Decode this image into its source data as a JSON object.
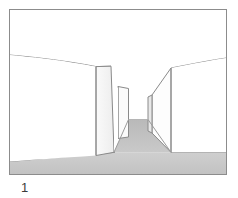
{
  "figure": {
    "caption_label": "1",
    "title": "",
    "frame": {
      "x": 9,
      "y": 9,
      "width": 218,
      "height": 166,
      "stroke_color": "#8c8c8c",
      "fill_color": "#ffffff",
      "stroke_width": 1
    },
    "palette": {
      "outline": "#7a7a7a",
      "outline_light": "#9b9b9b",
      "sky_fill": "#ffffff",
      "wall_fill": "#ffffff",
      "wall_shade_fill": "#f2f2f2",
      "ground_fill": "#c9c9c9",
      "ground_fill_dark": "#bdbdbd",
      "caption_color": "#3b3b3b",
      "page_background": "#ffffff"
    },
    "scene": {
      "type": "perspective-corridor-line-drawing",
      "description_name": "corridor-between-two-walls",
      "vanishing_point": {
        "x": 131,
        "y": 120
      },
      "horizon": {
        "name": "upper-wall-top-curve",
        "left_start": {
          "x": 10,
          "y": 55
        },
        "left_end": {
          "x": 111,
          "y": 66
        },
        "right_start": {
          "x": 170,
          "y": 68
        },
        "right_end": {
          "x": 226,
          "y": 58
        }
      },
      "ground_line": {
        "name": "ground-front-curve",
        "left_point": {
          "x": 10,
          "y": 161
        },
        "mid_point": {
          "x": 115,
          "y": 152
        },
        "right_point": {
          "x": 226,
          "y": 152
        }
      },
      "left_wall": {
        "name": "left-wall-near-panel",
        "top_front": {
          "x": 96,
          "y": 67
        },
        "top_back": {
          "x": 111,
          "y": 66
        },
        "bottom_front": {
          "x": 96,
          "y": 155
        },
        "bottom_back": {
          "x": 114,
          "y": 152
        }
      },
      "left_wall_far": {
        "name": "left-wall-far-panel",
        "top_front": {
          "x": 118,
          "y": 86
        },
        "top_back": {
          "x": 128,
          "y": 88
        },
        "bottom_front": {
          "x": 118,
          "y": 138
        },
        "bottom_back": {
          "x": 128,
          "y": 137
        }
      },
      "right_wall": {
        "name": "right-wall-near-panel",
        "top_back": {
          "x": 152,
          "y": 95
        },
        "top_front": {
          "x": 171,
          "y": 68
        },
        "bottom_back": {
          "x": 152,
          "y": 133
        },
        "bottom_front": {
          "x": 171,
          "y": 152
        }
      },
      "right_wall_far": {
        "name": "right-wall-far-panel",
        "top": {
          "x": 148,
          "y": 97
        },
        "bottom": {
          "x": 148,
          "y": 131
        }
      },
      "corridor_floor": {
        "name": "corridor-floor-strip",
        "near_left": {
          "x": 114,
          "y": 152
        },
        "near_right": {
          "x": 171,
          "y": 152
        },
        "far_left": {
          "x": 128,
          "y": 120
        },
        "far_right": {
          "x": 148,
          "y": 120
        }
      }
    }
  }
}
